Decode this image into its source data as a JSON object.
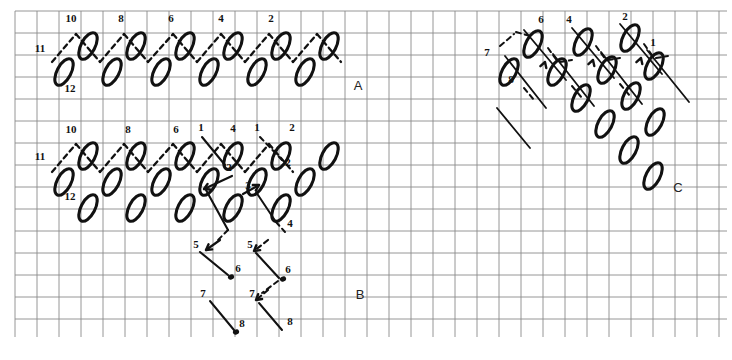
{
  "figure": {
    "title": "",
    "background": "#ffffff",
    "ink_color": "#111111",
    "grid_color": "#8a8a8a",
    "grid_spacing_px": 22
  },
  "panels": [
    {
      "id": "A",
      "label": "A",
      "x": 358,
      "y": 90
    },
    {
      "id": "B",
      "label": "B",
      "x": 360,
      "y": 299
    },
    {
      "id": "C",
      "label": "C",
      "x": 678,
      "y": 192
    }
  ],
  "panel_A": {
    "label": "A",
    "top_numbers": [
      "10",
      "8",
      "6",
      "4",
      "2"
    ],
    "left_numbers": [
      "11",
      "12"
    ],
    "top_number_positions": [
      [
        71,
        22
      ],
      [
        121,
        22
      ],
      [
        171,
        22
      ],
      [
        221,
        22
      ],
      [
        271,
        22
      ]
    ],
    "left_number_positions": [
      [
        40,
        52
      ],
      [
        70,
        92
      ]
    ],
    "ellipse_count": 15,
    "rows": 2
  },
  "panel_B": {
    "label": "B",
    "top_numbers": [
      "10",
      "8",
      "6",
      "1",
      "4",
      "1",
      "2"
    ],
    "left_numbers": [
      "11",
      "12"
    ],
    "inner_numbers": [
      "2",
      "2",
      "3",
      "4",
      "5",
      "5",
      "6",
      "6",
      "7",
      "7",
      "8",
      "8"
    ],
    "top_number_positions": [
      [
        71,
        133
      ],
      [
        128,
        133
      ],
      [
        176,
        133
      ],
      [
        201,
        131
      ],
      [
        233,
        132
      ],
      [
        257,
        131
      ],
      [
        292,
        131
      ]
    ],
    "left_number_positions": [
      [
        40,
        160
      ],
      [
        70,
        200
      ]
    ],
    "ellipse_count": 21,
    "rows": 3,
    "arrow_sequences": [
      {
        "from": "1",
        "to": "2"
      },
      {
        "from": "1",
        "to": "2"
      },
      {
        "from": "3",
        "to": "4"
      },
      {
        "from": "5",
        "to": "6"
      },
      {
        "from": "5",
        "to": "6"
      },
      {
        "from": "7",
        "to": "8"
      },
      {
        "from": "7",
        "to": "8"
      }
    ]
  },
  "panel_C": {
    "label": "C",
    "numbers": [
      "7",
      "8",
      "6",
      "4",
      "2",
      "1"
    ],
    "number_positions": [
      [
        487,
        56
      ],
      [
        511,
        83
      ],
      [
        541,
        23
      ],
      [
        569,
        23
      ],
      [
        625,
        20
      ],
      [
        653,
        46
      ]
    ],
    "ellipse_count": 18,
    "diagonal_columns": 4
  },
  "annotations": {
    "numbers_used": [
      "1",
      "2",
      "3",
      "4",
      "5",
      "6",
      "7",
      "8",
      "10",
      "11",
      "12"
    ],
    "panel_letters": [
      "A",
      "B",
      "C"
    ]
  }
}
